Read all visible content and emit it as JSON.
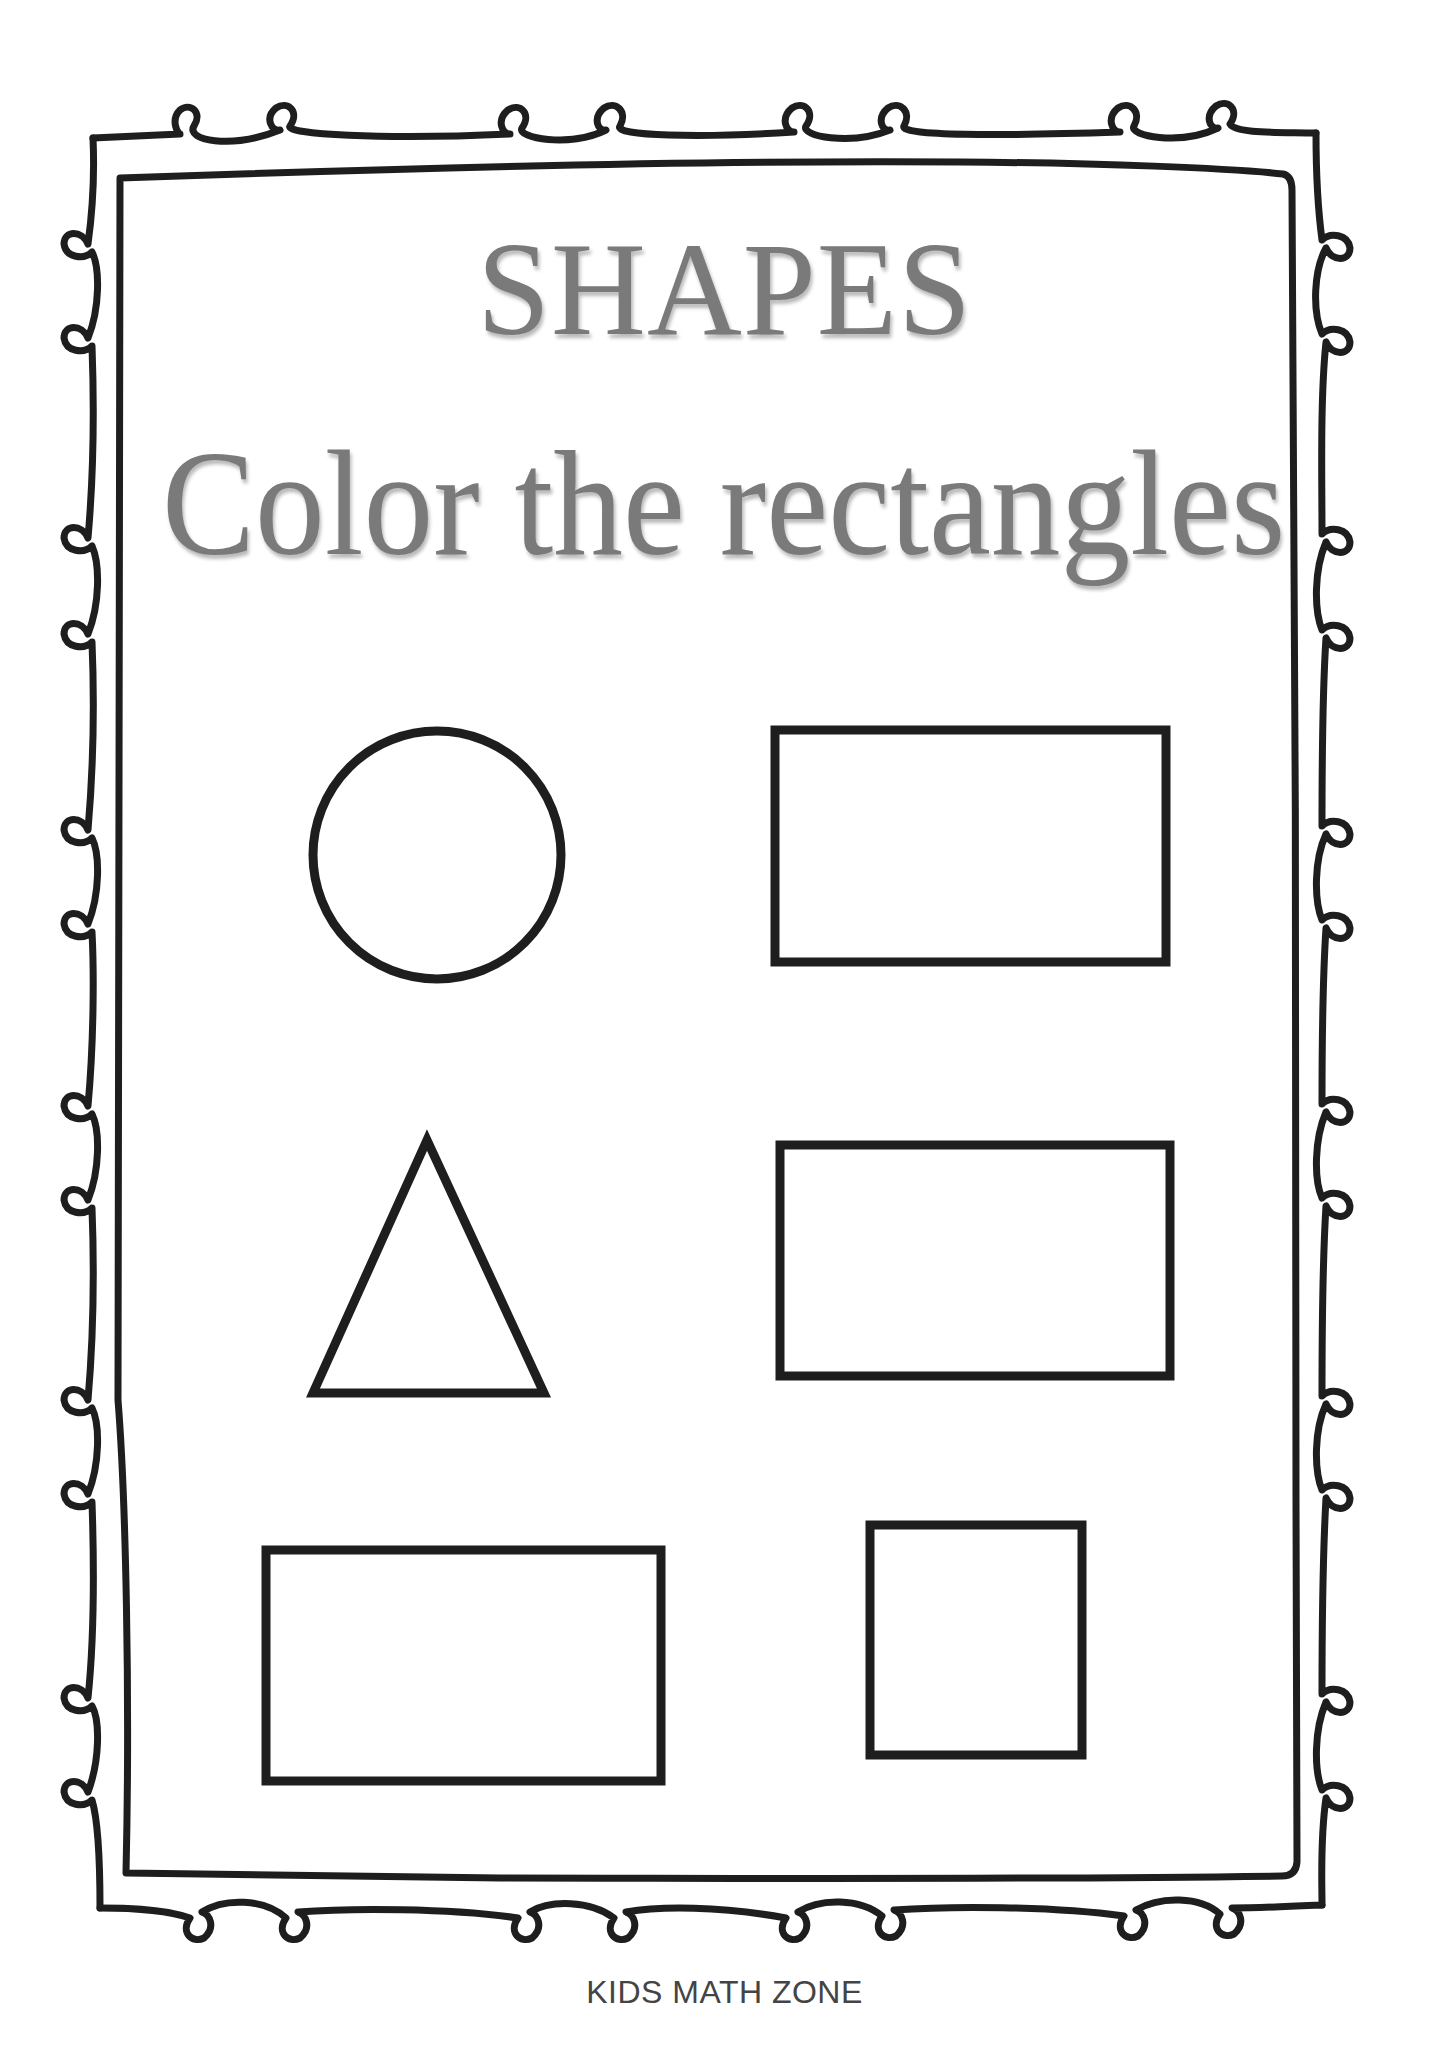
{
  "worksheet": {
    "title": "SHAPES",
    "instruction": "Color the rectangles",
    "footer": "KIDS MATH ZONE"
  },
  "colors": {
    "title_text": "#7a7a7a",
    "footer_text": "#444444",
    "outline": "#1e1e1e",
    "background": "#ffffff"
  },
  "shapes": [
    {
      "id": "shape-1",
      "type": "circle",
      "position": "row 1, left",
      "is_target": false
    },
    {
      "id": "shape-2",
      "type": "rectangle",
      "position": "row 1, right",
      "is_target": true
    },
    {
      "id": "shape-3",
      "type": "triangle",
      "position": "row 2, left",
      "is_target": false
    },
    {
      "id": "shape-4",
      "type": "rectangle",
      "position": "row 2, right",
      "is_target": true
    },
    {
      "id": "shape-5",
      "type": "rectangle",
      "position": "row 3, left",
      "is_target": true
    },
    {
      "id": "shape-6",
      "type": "square",
      "position": "row 3, right",
      "is_target": false
    }
  ],
  "border": {
    "style": "double-line frame with curly loops",
    "icon": "decorative-loop-border"
  }
}
